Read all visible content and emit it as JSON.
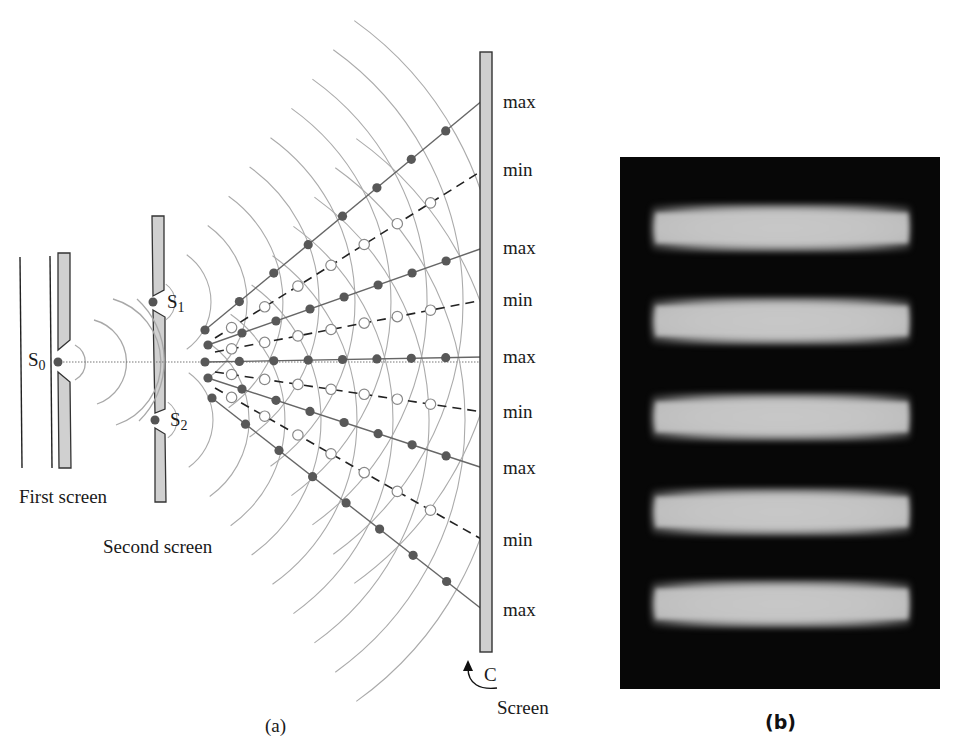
{
  "figure_a": {
    "caption": "(a)",
    "labels": {
      "s0": "S",
      "s0_sub": "0",
      "s1": "S",
      "s1_sub": "1",
      "s2": "S",
      "s2_sub": "2",
      "first_screen": "First screen",
      "second_screen": "Second screen",
      "screen_c": "C",
      "screen": "Screen"
    },
    "screen_markers": [
      {
        "label": "max",
        "y": 100
      },
      {
        "label": "min",
        "y": 170
      },
      {
        "label": "max",
        "y": 248
      },
      {
        "label": "min",
        "y": 300
      },
      {
        "label": "max",
        "y": 357
      },
      {
        "label": "min",
        "y": 412
      },
      {
        "label": "max",
        "y": 468
      },
      {
        "label": "min",
        "y": 540
      },
      {
        "label": "max",
        "y": 610
      }
    ],
    "colors": {
      "wavefront": "#a8a8a8",
      "screen_fill": "#cfcfcf",
      "screen_stroke": "#333333",
      "constructive_dot": "#555555",
      "antinodal_line": "#666666",
      "nodal_line": "#222222"
    }
  },
  "figure_b": {
    "caption": "(b)",
    "bright_fringe_count": 5,
    "background_color": "#070707",
    "fringe_color": "#c6c6c6"
  }
}
